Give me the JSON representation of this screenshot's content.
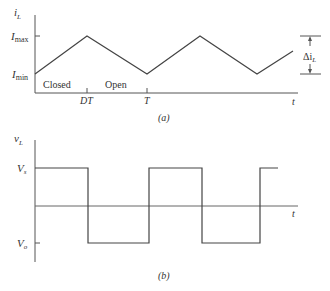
{
  "figure_a": {
    "caption": "(a)",
    "y_axis_label": "i",
    "y_axis_label_sub": "L",
    "x_axis_label": "t",
    "y_ticks": [
      {
        "label": "I",
        "sub": "max"
      },
      {
        "label": "I",
        "sub": "min"
      }
    ],
    "x_ticks": [
      "DT",
      "T"
    ],
    "region_labels": [
      "Closed",
      "Open"
    ],
    "ripple_label": "Δi",
    "ripple_label_sub": "L",
    "waveform": "triangle"
  },
  "figure_b": {
    "caption": "(b)",
    "y_axis_label": "v",
    "y_axis_label_sub": "L",
    "x_axis_label": "t",
    "y_ticks": [
      {
        "label": "V",
        "sub": "s"
      },
      {
        "label": "V",
        "sub": "o"
      }
    ],
    "waveform": "square"
  },
  "colors": {
    "line": "#444444",
    "axis": "#555555",
    "text": "#333333"
  }
}
